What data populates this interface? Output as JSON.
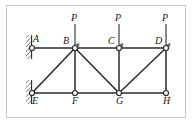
{
  "figure": {
    "type": "truss-diagram",
    "frame": {
      "border_color": "#c8c8c8"
    },
    "colors": {
      "member": "#2b2b2b",
      "joint_fill": "#ffffff",
      "joint_stroke": "#2b2b2b",
      "load_arrow": "#6e6e6e",
      "hatch": "#4a4a4a",
      "label": "#1a1a1a"
    },
    "joints": [
      {
        "id": "A",
        "label": "A",
        "x": 32,
        "y": 48,
        "label_x": 33,
        "label_y": 34,
        "support": "pin-wall"
      },
      {
        "id": "B",
        "label": "B",
        "x": 75,
        "y": 48,
        "label_x": 63,
        "label_y": 36,
        "support": "none"
      },
      {
        "id": "C",
        "label": "C",
        "x": 119,
        "y": 48,
        "label_x": 108,
        "label_y": 36,
        "support": "none"
      },
      {
        "id": "D",
        "label": "D",
        "x": 166,
        "y": 48,
        "label_x": 155,
        "label_y": 36,
        "support": "none"
      },
      {
        "id": "E",
        "label": "E",
        "x": 32,
        "y": 93,
        "label_x": 32,
        "label_y": 96,
        "support": "pin-wall"
      },
      {
        "id": "F",
        "label": "F",
        "x": 75,
        "y": 93,
        "label_x": 72,
        "label_y": 96,
        "support": "none"
      },
      {
        "id": "G",
        "label": "G",
        "x": 119,
        "y": 93,
        "label_x": 116,
        "label_y": 96,
        "support": "none"
      },
      {
        "id": "H",
        "label": "H",
        "x": 166,
        "y": 93,
        "label_x": 163,
        "label_y": 96,
        "support": "none"
      }
    ],
    "members": [
      {
        "id": "AB",
        "from": "A",
        "to": "B",
        "kind": "top-chord"
      },
      {
        "id": "BC",
        "from": "B",
        "to": "C",
        "kind": "top-chord"
      },
      {
        "id": "CD",
        "from": "C",
        "to": "D",
        "kind": "top-chord"
      },
      {
        "id": "EF",
        "from": "E",
        "to": "F",
        "kind": "bottom-chord"
      },
      {
        "id": "FG",
        "from": "F",
        "to": "G",
        "kind": "bottom-chord"
      },
      {
        "id": "GH",
        "from": "G",
        "to": "H",
        "kind": "bottom-chord"
      },
      {
        "id": "BF",
        "from": "B",
        "to": "F",
        "kind": "vertical"
      },
      {
        "id": "CG",
        "from": "C",
        "to": "G",
        "kind": "vertical"
      },
      {
        "id": "DH",
        "from": "D",
        "to": "H",
        "kind": "vertical"
      },
      {
        "id": "EB",
        "from": "E",
        "to": "B",
        "kind": "diagonal"
      },
      {
        "id": "BG",
        "from": "B",
        "to": "G",
        "kind": "diagonal"
      },
      {
        "id": "GD",
        "from": "G",
        "to": "D",
        "kind": "diagonal"
      }
    ],
    "loads": [
      {
        "id": "load-B",
        "label": "P",
        "at": "B",
        "x": 75,
        "label_x": 71,
        "label_y": 13,
        "tail_y": 24,
        "head_y": 46,
        "direction": "down"
      },
      {
        "id": "load-C",
        "label": "P",
        "at": "C",
        "x": 119,
        "label_x": 115,
        "label_y": 13,
        "tail_y": 24,
        "head_y": 46,
        "direction": "down"
      },
      {
        "id": "load-D",
        "label": "P",
        "at": "D",
        "x": 166,
        "label_x": 162,
        "label_y": 13,
        "tail_y": 24,
        "head_y": 46,
        "direction": "down"
      }
    ],
    "supports": [
      {
        "id": "support-A",
        "joint": "A",
        "type": "pin-wall",
        "wall_x": 26,
        "wall_y": 35,
        "wall_height": 24
      },
      {
        "id": "support-E",
        "joint": "E",
        "type": "pin-wall",
        "wall_x": 26,
        "wall_y": 80,
        "wall_height": 24
      }
    ]
  }
}
